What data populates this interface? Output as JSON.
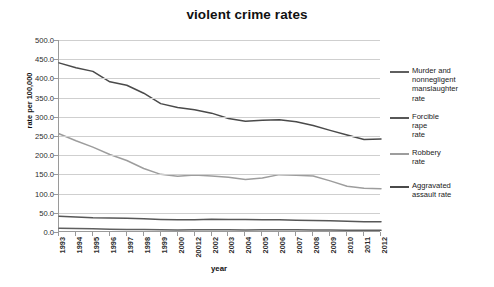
{
  "chart_data": {
    "type": "line",
    "title": "violent crime rates",
    "xlabel": "year",
    "ylabel": "rate per 100,000",
    "grid": true,
    "legend_position": "right",
    "ylim": [
      0.0,
      500.0
    ],
    "ytick_labels": [
      "500.0",
      "450.0",
      "400.0",
      "350.0",
      "300.0",
      "250.0",
      "200.0",
      "150.0",
      "100.0",
      "50.0",
      "0.0"
    ],
    "ytick_values": [
      500.0,
      450.0,
      400.0,
      350.0,
      300.0,
      250.0,
      200.0,
      150.0,
      100.0,
      50.0,
      0.0
    ],
    "categories": [
      "1993",
      "1994",
      "1995",
      "1996",
      "1997",
      "1998",
      "1999",
      "2000",
      "20012",
      "2002",
      "2003",
      "2004",
      "2005",
      "2006",
      "2007",
      "2008",
      "2009",
      "2010",
      "2011",
      "2012"
    ],
    "series": [
      {
        "name": "Murder and nonnegligent manslaughter rate",
        "legend_label": "Murder and\nnonnegligent\nmanslaughter\nrate",
        "color": "#5f5f5f",
        "values": [
          9.5,
          9.0,
          8.2,
          7.4,
          6.8,
          6.3,
          5.7,
          5.5,
          5.6,
          5.6,
          5.7,
          5.5,
          5.6,
          5.8,
          5.7,
          5.4,
          5.0,
          4.8,
          4.7,
          4.7
        ]
      },
      {
        "name": "Forcible rape rate",
        "legend_label": "Forcible\nrape\nrate",
        "color": "#575757",
        "values": [
          41.1,
          39.3,
          37.1,
          36.3,
          35.9,
          34.5,
          32.8,
          32.0,
          31.8,
          33.1,
          32.3,
          32.4,
          31.8,
          31.6,
          30.6,
          29.8,
          29.1,
          27.7,
          27.0,
          26.9
        ]
      },
      {
        "name": "Robbery rate",
        "legend_label": "Robbery\nrate",
        "color": "#9d9d9d",
        "values": [
          255.9,
          237.7,
          220.9,
          201.9,
          186.2,
          165.5,
          150.1,
          145.0,
          148.5,
          146.1,
          142.5,
          136.7,
          140.8,
          149.4,
          147.6,
          145.9,
          133.1,
          119.3,
          113.9,
          112.9
        ]
      },
      {
        "name": "Aggravated assault rate",
        "legend_label": "Aggravated\nassault rate",
        "color": "#4a4a4a",
        "values": [
          440.5,
          427.6,
          418.3,
          391.0,
          382.1,
          361.4,
          334.3,
          324.0,
          318.6,
          309.5,
          295.4,
          288.6,
          290.8,
          292.0,
          287.2,
          277.5,
          264.7,
          252.8,
          241.1,
          242.3
        ]
      }
    ]
  }
}
